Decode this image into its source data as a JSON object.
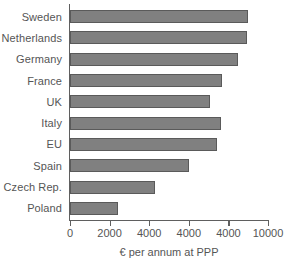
{
  "chart_data": {
    "type": "bar",
    "orientation": "horizontal",
    "title": "",
    "xlabel": "€ per annum at PPP",
    "ylabel": "",
    "categories": [
      "Sweden",
      "Netherlands",
      "Germany",
      "France",
      "UK",
      "Italy",
      "EU",
      "Spain",
      "Czech Rep.",
      "Poland"
    ],
    "values": [
      9000,
      8950,
      8500,
      7700,
      7050,
      7650,
      7400,
      6000,
      4300,
      2400
    ],
    "xlim": [
      0,
      10000
    ],
    "xticks": [
      0,
      2000,
      4000,
      6000,
      8000,
      10000
    ],
    "xtick_labels": [
      "0",
      "2000",
      "4000",
      "4000",
      "4000",
      "10000"
    ],
    "grid": false,
    "legend": false,
    "bar_color": "#808080",
    "bar_edge_color": "#5a5a5a",
    "axis_color": "#5f5f5f",
    "text_color": "#555555",
    "background": "#ffffff"
  }
}
